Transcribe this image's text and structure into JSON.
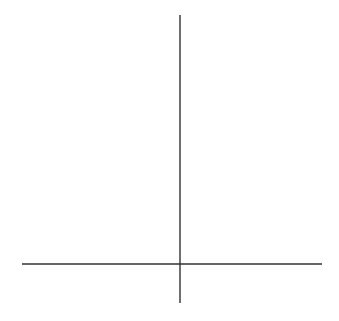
{
  "chart_data": {
    "type": "line",
    "title": "",
    "xlabel": "x",
    "ylabel": "y",
    "xlim": [
      -3.5,
      3.2
    ],
    "ylim": [
      -0.9,
      5.4
    ],
    "grid": true,
    "x_ticks": [
      "−3",
      "−2",
      "−1",
      "0",
      "1",
      "2",
      "3"
    ],
    "y_ticks": [
      "1",
      "2",
      "3",
      "4",
      "5"
    ],
    "series": [
      {
        "name": "y = x² + 2x + 2",
        "equation": "y = (x + 1)^2 + 1",
        "x": [
          -3.2,
          -3,
          -2.5,
          -2,
          -1.5,
          -1,
          -0.5,
          0,
          0.5,
          1,
          1.2
        ],
        "y": [
          5.84,
          5,
          3.25,
          2,
          1.25,
          1,
          1.25,
          2,
          3.25,
          5,
          5.84
        ]
      }
    ],
    "annotations": [
      {
        "text": "vertex",
        "x": -1,
        "y": 1
      },
      {
        "text": "y-intercept",
        "x": 0,
        "y": 2
      }
    ]
  },
  "labels": {
    "x_axis": "x",
    "y_axis": "y",
    "x_ticks": [
      "−3",
      "−2",
      "−1",
      "0",
      "1",
      "2",
      "3"
    ],
    "y_ticks": [
      "1",
      "2",
      "3",
      "4",
      "5"
    ]
  }
}
